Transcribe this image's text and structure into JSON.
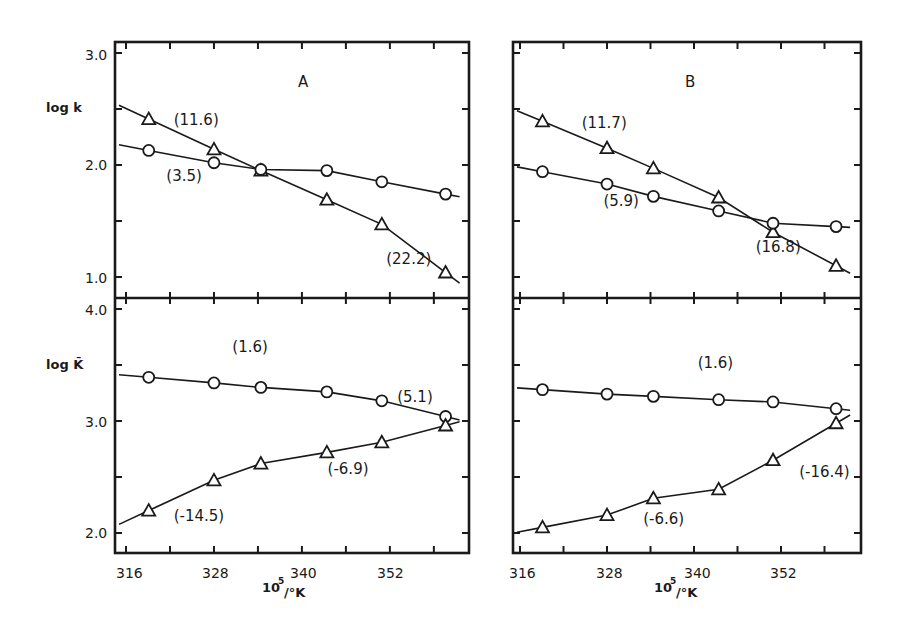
{
  "chart_data": [
    {
      "type": "line",
      "panel": "A",
      "row": "top",
      "title": "A",
      "xlabel": "10^5/°K",
      "ylabel": "log k",
      "xlim": [
        316,
        362
      ],
      "ylim": [
        0.9,
        3.1
      ],
      "yticks": [
        1.0,
        2.0,
        3.0
      ],
      "ytick_labels": [
        "1.0",
        "2.0",
        "3.0"
      ],
      "grid": false,
      "series": [
        {
          "name": "triangle",
          "marker": "triangle",
          "x": [
            319.1,
            328.0,
            334.4,
            343.4,
            350.9,
            359.6
          ],
          "y": [
            2.41,
            2.14,
            1.95,
            1.69,
            1.47,
            1.04
          ]
        },
        {
          "name": "circle",
          "marker": "circle",
          "x": [
            319.1,
            328.0,
            334.4,
            343.4,
            350.9,
            359.6
          ],
          "y": [
            2.13,
            2.02,
            1.96,
            1.95,
            1.85,
            1.74
          ]
        }
      ],
      "annotations": [
        {
          "text": "(11.6)",
          "x": 322.5,
          "y": 2.36
        },
        {
          "text": "(3.5)",
          "x": 321.5,
          "y": 1.86
        },
        {
          "text": "(22.2)",
          "x": 351.5,
          "y": 1.12
        }
      ]
    },
    {
      "type": "line",
      "panel": "B",
      "row": "top",
      "title": "B",
      "xlabel": "10^5/°K",
      "ylabel": "log k",
      "xlim": [
        316,
        362
      ],
      "ylim": [
        0.9,
        3.1
      ],
      "yticks": [
        1.0,
        2.0,
        3.0
      ],
      "grid": false,
      "series": [
        {
          "name": "triangle",
          "marker": "triangle",
          "x": [
            319.1,
            328.0,
            334.4,
            343.4,
            350.9,
            359.6
          ],
          "y": [
            2.39,
            2.15,
            1.97,
            1.71,
            1.4,
            1.1
          ]
        },
        {
          "name": "circle",
          "marker": "circle",
          "x": [
            319.1,
            328.0,
            334.4,
            343.4,
            350.9,
            359.6
          ],
          "y": [
            1.94,
            1.83,
            1.72,
            1.59,
            1.48,
            1.45
          ]
        }
      ],
      "annotations": [
        {
          "text": "(11.7)",
          "x": 324.5,
          "y": 2.33
        },
        {
          "text": "(5.9)",
          "x": 327.5,
          "y": 1.63
        },
        {
          "text": "(16.8)",
          "x": 348.5,
          "y": 1.22
        }
      ]
    },
    {
      "type": "line",
      "panel": "A",
      "row": "bottom",
      "xlabel": "10^5/°K",
      "ylabel": "log K̄",
      "xlim": [
        316,
        362
      ],
      "ylim": [
        1.8,
        4.1
      ],
      "yticks": [
        2.0,
        3.0,
        4.0
      ],
      "ytick_labels": [
        "2.0",
        "3.0",
        "4.0"
      ],
      "xticks": [
        316,
        328,
        340,
        352
      ],
      "grid": false,
      "series": [
        {
          "name": "circle",
          "marker": "circle",
          "x": [
            319.1,
            328.0,
            334.4,
            343.4,
            350.9,
            359.6
          ],
          "y": [
            3.39,
            3.34,
            3.3,
            3.26,
            3.18,
            3.04
          ]
        },
        {
          "name": "triangle",
          "marker": "triangle",
          "x": [
            319.1,
            328.0,
            334.4,
            343.4,
            350.9,
            359.6
          ],
          "y": [
            2.2,
            2.47,
            2.62,
            2.72,
            2.81,
            2.96
          ]
        }
      ],
      "annotations": [
        {
          "text": "(1.6)",
          "x": 330.5,
          "y": 3.62
        },
        {
          "text": "(5.1)",
          "x": 353.0,
          "y": 3.17
        },
        {
          "text": "(-6.9)",
          "x": 343.5,
          "y": 2.53
        },
        {
          "text": "(-14.5)",
          "x": 322.5,
          "y": 2.11
        }
      ]
    },
    {
      "type": "line",
      "panel": "B",
      "row": "bottom",
      "xlabel": "10^5/°K",
      "ylabel": "log K̄",
      "xlim": [
        316,
        362
      ],
      "ylim": [
        1.8,
        4.1
      ],
      "yticks": [
        2.0,
        3.0,
        4.0
      ],
      "xticks": [
        316,
        328,
        340,
        352
      ],
      "grid": false,
      "series": [
        {
          "name": "circle",
          "marker": "circle",
          "x": [
            319.1,
            328.0,
            334.4,
            343.4,
            350.9,
            359.6
          ],
          "y": [
            3.28,
            3.24,
            3.22,
            3.19,
            3.17,
            3.11
          ]
        },
        {
          "name": "triangle",
          "marker": "triangle",
          "x": [
            319.1,
            328.0,
            334.4,
            343.4,
            350.9,
            359.6
          ],
          "y": [
            2.05,
            2.16,
            2.31,
            2.39,
            2.65,
            2.98
          ]
        }
      ],
      "annotations": [
        {
          "text": "(1.6)",
          "x": 340.5,
          "y": 3.47
        },
        {
          "text": "(-16.4)",
          "x": 354.5,
          "y": 2.5
        },
        {
          "text": "(-6.6)",
          "x": 333.0,
          "y": 2.08
        }
      ]
    }
  ],
  "labels": {
    "panel_a": "A",
    "panel_b": "B",
    "ylabel_top": "log k",
    "ylabel_bottom": "log K̄",
    "xlabel_main": "10",
    "xlabel_sup": "5",
    "xlabel_tail": "/°K",
    "yticks_top": [
      "3.0",
      "2.0",
      "1.0"
    ],
    "yticks_bottom": [
      "4.0",
      "3.0",
      "2.0"
    ],
    "xticks": [
      "316",
      "328",
      "340",
      "352"
    ]
  }
}
